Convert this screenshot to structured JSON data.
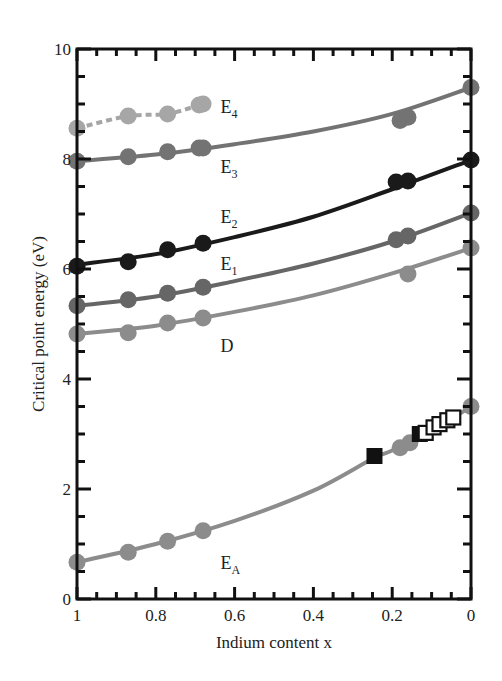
{
  "chart_data": {
    "type": "line",
    "title": "",
    "xlabel": "Indium content x",
    "ylabel": "Critical point energy (eV)",
    "xlim": [
      1,
      0
    ],
    "ylim": [
      0,
      10
    ],
    "x_reversed": true,
    "grid": false,
    "legend": "inline labels",
    "x_ticks": [
      "1",
      "0.8",
      "0.6",
      "0.4",
      "0.2",
      "0"
    ],
    "x_tick_values": [
      1,
      0.8,
      0.6,
      0.4,
      0.2,
      0
    ],
    "y_ticks": [
      "0",
      "2",
      "4",
      "6",
      "8",
      "10"
    ],
    "y_tick_values": [
      0,
      2,
      4,
      6,
      8,
      10
    ],
    "series": [
      {
        "name": "E4",
        "label_main": "E",
        "label_sub": "4",
        "color": "#a6a6a6",
        "line_style": "dashed",
        "marker": "circle",
        "points": [
          [
            1.0,
            8.56
          ],
          [
            0.87,
            8.78
          ],
          [
            0.77,
            8.82
          ],
          [
            0.69,
            8.98
          ],
          [
            0.68,
            9.0
          ]
        ],
        "fit": [
          [
            1.0,
            8.56
          ],
          [
            0.87,
            8.78
          ],
          [
            0.77,
            8.82
          ],
          [
            0.69,
            8.98
          ],
          [
            0.68,
            9.0
          ]
        ],
        "label_pos": [
          0.6,
          8.95
        ]
      },
      {
        "name": "E3",
        "label_main": "E",
        "label_sub": "3",
        "color": "#737373",
        "line_style": "solid",
        "marker": "circle",
        "points": [
          [
            1.0,
            7.96
          ],
          [
            0.87,
            8.04
          ],
          [
            0.77,
            8.13
          ],
          [
            0.69,
            8.2
          ],
          [
            0.68,
            8.2
          ],
          [
            0.18,
            8.7
          ],
          [
            0.16,
            8.76
          ],
          [
            0.0,
            9.3
          ]
        ],
        "fit": [
          [
            1.0,
            7.96
          ],
          [
            0.8,
            8.08
          ],
          [
            0.6,
            8.27
          ],
          [
            0.4,
            8.5
          ],
          [
            0.2,
            8.82
          ],
          [
            0.0,
            9.3
          ]
        ],
        "label_pos": [
          0.6,
          7.85
        ]
      },
      {
        "name": "E2",
        "label_main": "E",
        "label_sub": "2",
        "color": "#1a1a1a",
        "line_style": "solid",
        "marker": "circle",
        "points": [
          [
            1.0,
            6.05
          ],
          [
            0.87,
            6.13
          ],
          [
            0.77,
            6.35
          ],
          [
            0.68,
            6.47
          ],
          [
            0.19,
            7.58
          ],
          [
            0.16,
            7.6
          ],
          [
            0.0,
            7.98
          ]
        ],
        "fit": [
          [
            1.0,
            6.08
          ],
          [
            0.8,
            6.27
          ],
          [
            0.6,
            6.58
          ],
          [
            0.4,
            6.95
          ],
          [
            0.2,
            7.45
          ],
          [
            0.0,
            7.98
          ]
        ],
        "label_pos": [
          0.6,
          6.95
        ]
      },
      {
        "name": "E1",
        "label_main": "E",
        "label_sub": "1",
        "color": "#666666",
        "line_style": "solid",
        "marker": "circle",
        "points": [
          [
            1.0,
            5.33
          ],
          [
            0.87,
            5.44
          ],
          [
            0.77,
            5.56
          ],
          [
            0.68,
            5.67
          ],
          [
            0.19,
            6.53
          ],
          [
            0.16,
            6.6
          ],
          [
            0.0,
            7.02
          ]
        ],
        "fit": [
          [
            1.0,
            5.33
          ],
          [
            0.8,
            5.5
          ],
          [
            0.6,
            5.78
          ],
          [
            0.4,
            6.1
          ],
          [
            0.2,
            6.5
          ],
          [
            0.0,
            7.02
          ]
        ],
        "label_pos": [
          0.6,
          6.1
        ]
      },
      {
        "name": "D",
        "label_main": "D",
        "label_sub": "",
        "color": "#8c8c8c",
        "line_style": "solid",
        "marker": "circle",
        "points": [
          [
            1.0,
            4.82
          ],
          [
            0.87,
            4.84
          ],
          [
            0.77,
            5.02
          ],
          [
            0.68,
            5.11
          ],
          [
            0.16,
            5.91
          ],
          [
            0.0,
            6.38
          ]
        ],
        "fit": [
          [
            1.0,
            4.82
          ],
          [
            0.8,
            4.97
          ],
          [
            0.6,
            5.22
          ],
          [
            0.4,
            5.52
          ],
          [
            0.2,
            5.92
          ],
          [
            0.0,
            6.38
          ]
        ],
        "label_pos": [
          0.6,
          4.6
        ]
      },
      {
        "name": "EA",
        "label_main": "E",
        "label_sub": "A",
        "color": "#8c8c8c",
        "line_style": "solid",
        "marker": "circle",
        "points": [
          [
            1.0,
            0.67
          ],
          [
            0.87,
            0.85
          ],
          [
            0.77,
            1.05
          ],
          [
            0.68,
            1.24
          ],
          [
            0.18,
            2.75
          ],
          [
            0.155,
            2.84
          ],
          [
            0.0,
            3.5
          ]
        ],
        "fit": [
          [
            1.0,
            0.67
          ],
          [
            0.8,
            1.0
          ],
          [
            0.6,
            1.42
          ],
          [
            0.4,
            1.97
          ],
          [
            0.25,
            2.55
          ],
          [
            0.2,
            2.7
          ],
          [
            0.1,
            3.05
          ],
          [
            0.0,
            3.5
          ]
        ],
        "label_pos": [
          0.6,
          0.65
        ]
      },
      {
        "name": "EA (filled squares)",
        "label_main": "",
        "label_sub": "",
        "color": "#111111",
        "line_style": "none",
        "marker": "square-filled",
        "points": [
          [
            0.245,
            2.6
          ],
          [
            0.13,
            3.0
          ]
        ],
        "fit": []
      },
      {
        "name": "EA (open squares)",
        "label_main": "",
        "label_sub": "",
        "color": "#111111",
        "line_style": "none",
        "marker": "square-open",
        "points": [
          [
            0.115,
            3.02
          ],
          [
            0.095,
            3.12
          ],
          [
            0.08,
            3.18
          ],
          [
            0.06,
            3.25
          ],
          [
            0.045,
            3.3
          ]
        ],
        "fit": []
      }
    ]
  }
}
